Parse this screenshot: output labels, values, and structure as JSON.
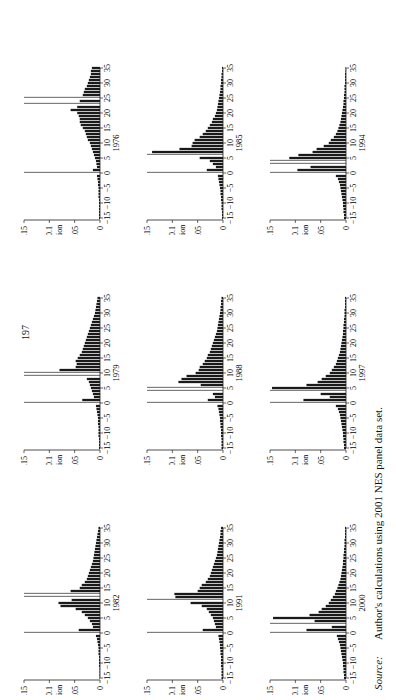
{
  "page_number": "197",
  "source": {
    "label": "Source:",
    "text": "Author's calculations using 2001 NES panel data set."
  },
  "colors": {
    "bar": "#1a1a1a",
    "spike": "#555555",
    "axis": "#222222"
  },
  "chart_data": [
    {
      "type": "bar",
      "title": "1976",
      "xlabel": "1976",
      "ylabel": "Fraction",
      "xlim": [
        -15,
        35
      ],
      "ylim": [
        0,
        0.15
      ],
      "xticks": [
        -15,
        -10,
        -5,
        0,
        5,
        10,
        15,
        20,
        25,
        30,
        35
      ],
      "yticks": [
        0,
        0.05,
        0.1,
        0.15
      ],
      "x": [
        -15,
        -14,
        -13,
        -12,
        -11,
        -10,
        -9,
        -8,
        -7,
        -6,
        -5,
        -4,
        -3,
        -2,
        -1,
        0,
        1,
        2,
        3,
        4,
        5,
        6,
        7,
        8,
        9,
        10,
        11,
        12,
        13,
        14,
        15,
        16,
        17,
        18,
        19,
        20,
        21,
        22,
        23,
        24,
        25,
        26,
        27,
        28,
        29,
        30,
        31,
        32,
        33,
        34,
        35
      ],
      "values": [
        0.002,
        0.002,
        0.002,
        0.002,
        0.002,
        0.002,
        0.002,
        0.003,
        0.003,
        0.003,
        0.003,
        0.004,
        0.004,
        0.005,
        0.006,
        0.15,
        0.014,
        0.006,
        0.007,
        0.008,
        0.01,
        0.012,
        0.014,
        0.016,
        0.018,
        0.02,
        0.024,
        0.026,
        0.028,
        0.03,
        0.034,
        0.038,
        0.04,
        0.04,
        0.042,
        0.045,
        0.058,
        0.045,
        0.15,
        0.04,
        0.15,
        0.034,
        0.032,
        0.03,
        0.026,
        0.024,
        0.022,
        0.02,
        0.018,
        0.018,
        0.016
      ]
    },
    {
      "type": "bar",
      "title": "1979",
      "xlabel": "1979",
      "ylabel": "Fraction",
      "xlim": [
        -15,
        35
      ],
      "ylim": [
        0,
        0.15
      ],
      "xticks": [
        -15,
        -10,
        -5,
        0,
        5,
        10,
        15,
        20,
        25,
        30,
        35
      ],
      "yticks": [
        0,
        0.05,
        0.1,
        0.15
      ],
      "x": [
        -15,
        -14,
        -13,
        -12,
        -11,
        -10,
        -9,
        -8,
        -7,
        -6,
        -5,
        -4,
        -3,
        -2,
        -1,
        0,
        1,
        2,
        3,
        4,
        5,
        6,
        7,
        8,
        9,
        10,
        11,
        12,
        13,
        14,
        15,
        16,
        17,
        18,
        19,
        20,
        21,
        22,
        23,
        24,
        25,
        26,
        27,
        28,
        29,
        30,
        31,
        32,
        33,
        34,
        35
      ],
      "values": [
        0.002,
        0.002,
        0.002,
        0.002,
        0.003,
        0.003,
        0.003,
        0.003,
        0.004,
        0.004,
        0.004,
        0.005,
        0.006,
        0.007,
        0.008,
        0.15,
        0.035,
        0.012,
        0.014,
        0.016,
        0.018,
        0.02,
        0.022,
        0.026,
        0.15,
        0.15,
        0.08,
        0.048,
        0.046,
        0.048,
        0.044,
        0.04,
        0.036,
        0.034,
        0.032,
        0.03,
        0.028,
        0.026,
        0.024,
        0.022,
        0.02,
        0.018,
        0.016,
        0.014,
        0.012,
        0.01,
        0.009,
        0.008,
        0.007,
        0.006,
        0.005
      ]
    },
    {
      "type": "bar",
      "title": "1982",
      "xlabel": "1982",
      "ylabel": "Fraction",
      "xlim": [
        -15,
        35
      ],
      "ylim": [
        0,
        0.15
      ],
      "xticks": [
        -15,
        -10,
        -5,
        0,
        5,
        10,
        15,
        20,
        25,
        30,
        35
      ],
      "yticks": [
        0,
        0.05,
        0.1,
        0.15
      ],
      "x": [
        -15,
        -14,
        -13,
        -12,
        -11,
        -10,
        -9,
        -8,
        -7,
        -6,
        -5,
        -4,
        -3,
        -2,
        -1,
        0,
        1,
        2,
        3,
        4,
        5,
        6,
        7,
        8,
        9,
        10,
        11,
        12,
        13,
        14,
        15,
        16,
        17,
        18,
        19,
        20,
        21,
        22,
        23,
        24,
        25,
        26,
        27,
        28,
        29,
        30,
        31,
        32,
        33,
        34,
        35
      ],
      "values": [
        0.001,
        0.001,
        0.001,
        0.001,
        0.002,
        0.002,
        0.002,
        0.002,
        0.003,
        0.003,
        0.003,
        0.004,
        0.005,
        0.006,
        0.008,
        0.15,
        0.042,
        0.014,
        0.016,
        0.02,
        0.024,
        0.03,
        0.036,
        0.048,
        0.078,
        0.082,
        0.056,
        0.15,
        0.15,
        0.058,
        0.04,
        0.036,
        0.03,
        0.026,
        0.024,
        0.022,
        0.02,
        0.018,
        0.016,
        0.014,
        0.013,
        0.012,
        0.011,
        0.01,
        0.009,
        0.008,
        0.007,
        0.006,
        0.005,
        0.004,
        0.003
      ]
    },
    {
      "type": "bar",
      "title": "1985",
      "xlabel": "1985",
      "ylabel": "Fraction",
      "xlim": [
        -15,
        35
      ],
      "ylim": [
        0,
        0.15
      ],
      "xticks": [
        -15,
        -10,
        -5,
        0,
        5,
        10,
        15,
        20,
        25,
        30,
        35
      ],
      "yticks": [
        0,
        0.05,
        0.1,
        0.15
      ],
      "x": [
        -15,
        -14,
        -13,
        -12,
        -11,
        -10,
        -9,
        -8,
        -7,
        -6,
        -5,
        -4,
        -3,
        -2,
        -1,
        0,
        1,
        2,
        3,
        4,
        5,
        6,
        7,
        8,
        9,
        10,
        11,
        12,
        13,
        14,
        15,
        16,
        17,
        18,
        19,
        20,
        21,
        22,
        23,
        24,
        25,
        26,
        27,
        28,
        29,
        30,
        31,
        32,
        33,
        34,
        35
      ],
      "values": [
        0.002,
        0.002,
        0.002,
        0.003,
        0.003,
        0.003,
        0.004,
        0.004,
        0.005,
        0.005,
        0.006,
        0.007,
        0.008,
        0.009,
        0.01,
        0.15,
        0.032,
        0.014,
        0.02,
        0.026,
        0.046,
        0.15,
        0.14,
        0.086,
        0.062,
        0.06,
        0.056,
        0.046,
        0.04,
        0.034,
        0.03,
        0.026,
        0.022,
        0.02,
        0.016,
        0.014,
        0.012,
        0.011,
        0.01,
        0.009,
        0.008,
        0.007,
        0.006,
        0.005,
        0.005,
        0.004,
        0.004,
        0.003,
        0.003,
        0.002,
        0.002
      ]
    },
    {
      "type": "bar",
      "title": "1988",
      "xlabel": "1988",
      "ylabel": "Fraction",
      "xlim": [
        -15,
        35
      ],
      "ylim": [
        0,
        0.15
      ],
      "xticks": [
        -15,
        -10,
        -5,
        0,
        5,
        10,
        15,
        20,
        25,
        30,
        35
      ],
      "yticks": [
        0,
        0.05,
        0.1,
        0.15
      ],
      "x": [
        -15,
        -14,
        -13,
        -12,
        -11,
        -10,
        -9,
        -8,
        -7,
        -6,
        -5,
        -4,
        -3,
        -2,
        -1,
        0,
        1,
        2,
        3,
        4,
        5,
        6,
        7,
        8,
        9,
        10,
        11,
        12,
        13,
        14,
        15,
        16,
        17,
        18,
        19,
        20,
        21,
        22,
        23,
        24,
        25,
        26,
        27,
        28,
        29,
        30,
        31,
        32,
        33,
        34,
        35
      ],
      "values": [
        0.003,
        0.003,
        0.003,
        0.003,
        0.004,
        0.004,
        0.004,
        0.005,
        0.005,
        0.006,
        0.006,
        0.007,
        0.008,
        0.009,
        0.011,
        0.15,
        0.03,
        0.016,
        0.02,
        0.15,
        0.15,
        0.044,
        0.088,
        0.082,
        0.072,
        0.054,
        0.048,
        0.046,
        0.04,
        0.036,
        0.032,
        0.03,
        0.026,
        0.024,
        0.022,
        0.02,
        0.018,
        0.016,
        0.014,
        0.012,
        0.011,
        0.01,
        0.009,
        0.008,
        0.007,
        0.006,
        0.005,
        0.005,
        0.004,
        0.004,
        0.003
      ]
    },
    {
      "type": "bar",
      "title": "1991",
      "xlabel": "1991",
      "ylabel": "Fraction",
      "xlim": [
        -15,
        35
      ],
      "ylim": [
        0,
        0.15
      ],
      "xticks": [
        -15,
        -10,
        -5,
        0,
        5,
        10,
        15,
        20,
        25,
        30,
        35
      ],
      "yticks": [
        0,
        0.05,
        0.1,
        0.15
      ],
      "x": [
        -15,
        -14,
        -13,
        -12,
        -11,
        -10,
        -9,
        -8,
        -7,
        -6,
        -5,
        -4,
        -3,
        -2,
        -1,
        0,
        1,
        2,
        3,
        4,
        5,
        6,
        7,
        8,
        9,
        10,
        11,
        12,
        13,
        14,
        15,
        16,
        17,
        18,
        19,
        20,
        21,
        22,
        23,
        24,
        25,
        26,
        27,
        28,
        29,
        30,
        31,
        32,
        33,
        34,
        35
      ],
      "values": [
        0.003,
        0.003,
        0.003,
        0.003,
        0.004,
        0.004,
        0.004,
        0.004,
        0.005,
        0.005,
        0.006,
        0.006,
        0.007,
        0.008,
        0.009,
        0.15,
        0.04,
        0.014,
        0.016,
        0.018,
        0.02,
        0.024,
        0.028,
        0.032,
        0.042,
        0.064,
        0.15,
        0.094,
        0.096,
        0.05,
        0.046,
        0.042,
        0.034,
        0.03,
        0.026,
        0.024,
        0.022,
        0.02,
        0.018,
        0.016,
        0.014,
        0.012,
        0.011,
        0.01,
        0.009,
        0.008,
        0.007,
        0.006,
        0.005,
        0.005,
        0.004
      ]
    },
    {
      "type": "bar",
      "title": "1994",
      "xlabel": "1994",
      "ylabel": "Fraction",
      "xlim": [
        -15,
        35
      ],
      "ylim": [
        0,
        0.15
      ],
      "xticks": [
        -15,
        -10,
        -5,
        0,
        5,
        10,
        15,
        20,
        25,
        30,
        35
      ],
      "yticks": [
        0,
        0.05,
        0.1,
        0.15
      ],
      "x": [
        -15,
        -14,
        -13,
        -12,
        -11,
        -10,
        -9,
        -8,
        -7,
        -6,
        -5,
        -4,
        -3,
        -2,
        -1,
        0,
        1,
        2,
        3,
        4,
        5,
        6,
        7,
        8,
        9,
        10,
        11,
        12,
        13,
        14,
        15,
        16,
        17,
        18,
        19,
        20,
        21,
        22,
        23,
        24,
        25,
        26,
        27,
        28,
        29,
        30,
        31,
        32,
        33,
        34,
        35
      ],
      "values": [
        0.004,
        0.004,
        0.005,
        0.005,
        0.006,
        0.006,
        0.007,
        0.008,
        0.009,
        0.01,
        0.011,
        0.012,
        0.014,
        0.016,
        0.02,
        0.15,
        0.096,
        0.07,
        0.15,
        0.15,
        0.112,
        0.094,
        0.066,
        0.058,
        0.044,
        0.034,
        0.03,
        0.024,
        0.02,
        0.017,
        0.015,
        0.013,
        0.011,
        0.01,
        0.009,
        0.008,
        0.007,
        0.006,
        0.005,
        0.005,
        0.004,
        0.004,
        0.003,
        0.003,
        0.003,
        0.002,
        0.002,
        0.002,
        0.002,
        0.001,
        0.001
      ]
    },
    {
      "type": "bar",
      "title": "1997",
      "xlabel": "1997",
      "ylabel": "Fraction",
      "xlim": [
        -15,
        35
      ],
      "ylim": [
        0,
        0.15
      ],
      "xticks": [
        -15,
        -10,
        -5,
        0,
        5,
        10,
        15,
        20,
        25,
        30,
        35
      ],
      "yticks": [
        0,
        0.05,
        0.1,
        0.15
      ],
      "x": [
        -15,
        -14,
        -13,
        -12,
        -11,
        -10,
        -9,
        -8,
        -7,
        -6,
        -5,
        -4,
        -3,
        -2,
        -1,
        0,
        1,
        2,
        3,
        4,
        5,
        6,
        7,
        8,
        9,
        10,
        11,
        12,
        13,
        14,
        15,
        16,
        17,
        18,
        19,
        20,
        21,
        22,
        23,
        24,
        25,
        26,
        27,
        28,
        29,
        30,
        31,
        32,
        33,
        34,
        35
      ],
      "values": [
        0.004,
        0.004,
        0.005,
        0.005,
        0.006,
        0.006,
        0.007,
        0.008,
        0.009,
        0.01,
        0.011,
        0.012,
        0.014,
        0.016,
        0.02,
        0.15,
        0.084,
        0.032,
        0.05,
        0.15,
        0.146,
        0.078,
        0.056,
        0.048,
        0.04,
        0.032,
        0.028,
        0.024,
        0.02,
        0.018,
        0.016,
        0.014,
        0.012,
        0.011,
        0.01,
        0.009,
        0.008,
        0.007,
        0.006,
        0.006,
        0.005,
        0.005,
        0.004,
        0.004,
        0.003,
        0.003,
        0.003,
        0.002,
        0.002,
        0.002,
        0.002
      ]
    },
    {
      "type": "bar",
      "title": "2000",
      "xlabel": "2000",
      "ylabel": "Fraction",
      "xlim": [
        -15,
        35
      ],
      "ylim": [
        0,
        0.15
      ],
      "xticks": [
        -15,
        -10,
        -5,
        0,
        5,
        10,
        15,
        20,
        25,
        30,
        35
      ],
      "yticks": [
        0,
        0.05,
        0.1,
        0.15
      ],
      "x": [
        -15,
        -14,
        -13,
        -12,
        -11,
        -10,
        -9,
        -8,
        -7,
        -6,
        -5,
        -4,
        -3,
        -2,
        -1,
        0,
        1,
        2,
        3,
        4,
        5,
        6,
        7,
        8,
        9,
        10,
        11,
        12,
        13,
        14,
        15,
        16,
        17,
        18,
        19,
        20,
        21,
        22,
        23,
        24,
        25,
        26,
        27,
        28,
        29,
        30,
        31,
        32,
        33,
        34,
        35
      ],
      "values": [
        0.004,
        0.004,
        0.005,
        0.005,
        0.006,
        0.006,
        0.007,
        0.008,
        0.009,
        0.01,
        0.011,
        0.012,
        0.014,
        0.016,
        0.018,
        0.15,
        0.078,
        0.028,
        0.15,
        0.062,
        0.144,
        0.072,
        0.054,
        0.048,
        0.04,
        0.034,
        0.03,
        0.026,
        0.022,
        0.02,
        0.017,
        0.015,
        0.013,
        0.011,
        0.01,
        0.009,
        0.008,
        0.007,
        0.006,
        0.006,
        0.005,
        0.005,
        0.004,
        0.004,
        0.003,
        0.003,
        0.003,
        0.002,
        0.002,
        0.002,
        0.002
      ]
    }
  ],
  "layout": {
    "panels": [
      {
        "index": 0,
        "left": 12,
        "top": 60
      },
      {
        "index": 1,
        "left": 135,
        "top": 60
      },
      {
        "index": 2,
        "left": 258,
        "top": 60
      },
      {
        "index": 3,
        "left": 12,
        "top": 290
      },
      {
        "index": 4,
        "left": 135,
        "top": 290
      },
      {
        "index": 5,
        "left": 258,
        "top": 290
      },
      {
        "index": 6,
        "left": 12,
        "top": 520
      },
      {
        "index": 7,
        "left": 135,
        "top": 520
      },
      {
        "index": 8,
        "left": 258,
        "top": 520
      }
    ]
  }
}
